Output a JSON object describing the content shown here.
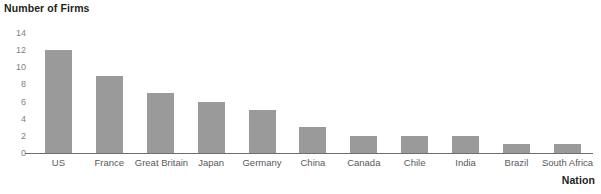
{
  "chart_data": {
    "type": "bar",
    "title": "",
    "xlabel": "Nation",
    "ylabel": "Number of Firms",
    "categories": [
      "US",
      "France",
      "Great Britain",
      "Japan",
      "Germany",
      "China",
      "Canada",
      "Chile",
      "India",
      "Brazil",
      "South Africa"
    ],
    "values": [
      12,
      9,
      7,
      6,
      5,
      3,
      2,
      2,
      2,
      1,
      1
    ],
    "ylim": [
      0,
      14
    ],
    "ytick_labels": [
      "14",
      "12",
      "10",
      "8",
      "6",
      "4",
      "2",
      "0"
    ],
    "ytick_values": [
      14,
      12,
      10,
      8,
      6,
      4,
      2,
      0
    ],
    "grid": false,
    "legend": false,
    "bar_color": "#9a9a9a",
    "axis_color": "#6d6e71",
    "tick_label_color": "#808285",
    "title_color": "#231f20"
  }
}
